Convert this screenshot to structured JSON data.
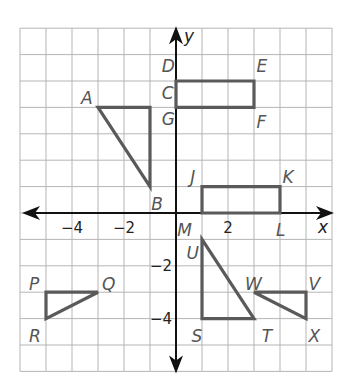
{
  "diagram": {
    "type": "coordinate-plane",
    "x_axis_label": "x",
    "y_axis_label": "y",
    "x_range": [
      -6,
      6
    ],
    "y_range": [
      -6,
      7
    ],
    "x_tick_labels": [
      {
        "value": -4,
        "text": "−4"
      },
      {
        "value": -2,
        "text": "−2"
      },
      {
        "value": 2,
        "text": "2"
      }
    ],
    "y_tick_labels": [
      {
        "value": -2,
        "text": "−2"
      },
      {
        "value": -4,
        "text": "−4"
      }
    ],
    "shapes": [
      {
        "name": "rectangle-DEFG",
        "points": [
          [
            0,
            5
          ],
          [
            3,
            5
          ],
          [
            3,
            4
          ],
          [
            0,
            4
          ]
        ]
      },
      {
        "name": "triangle-ACB",
        "points": [
          [
            -3,
            4
          ],
          [
            -1,
            4
          ],
          [
            -1,
            1
          ]
        ]
      },
      {
        "name": "rectangle-JKLM",
        "points": [
          [
            1,
            1
          ],
          [
            4,
            1
          ],
          [
            4,
            0
          ],
          [
            1,
            0
          ]
        ]
      },
      {
        "name": "triangle-PQR",
        "points": [
          [
            -5,
            -3
          ],
          [
            -3,
            -3
          ],
          [
            -5,
            -4
          ]
        ]
      },
      {
        "name": "triangle-UST",
        "points": [
          [
            1,
            -1
          ],
          [
            1,
            -4
          ],
          [
            3,
            -4
          ]
        ]
      },
      {
        "name": "triangle-WVX",
        "points": [
          [
            3,
            -3
          ],
          [
            5,
            -3
          ],
          [
            5,
            -4
          ]
        ]
      }
    ],
    "point_labels": [
      {
        "text": "D",
        "at": [
          -0.55,
          5.55
        ]
      },
      {
        "text": "E",
        "at": [
          3.1,
          5.55
        ]
      },
      {
        "text": "C",
        "at": [
          -0.55,
          4.55
        ]
      },
      {
        "text": "G",
        "at": [
          -0.55,
          3.55
        ]
      },
      {
        "text": "F",
        "at": [
          3.1,
          3.45
        ]
      },
      {
        "text": "A",
        "at": [
          -3.65,
          4.35
        ]
      },
      {
        "text": "B",
        "at": [
          -0.95,
          0.35
        ]
      },
      {
        "text": "J",
        "at": [
          0.55,
          1.35
        ]
      },
      {
        "text": "K",
        "at": [
          4.1,
          1.35
        ]
      },
      {
        "text": "M",
        "at": [
          0.05,
          -0.65
        ]
      },
      {
        "text": "L",
        "at": [
          3.85,
          -0.65
        ]
      },
      {
        "text": "U",
        "at": [
          0.4,
          -1.5
        ]
      },
      {
        "text": "S",
        "at": [
          0.6,
          -4.65
        ]
      },
      {
        "text": "T",
        "at": [
          3.3,
          -4.65
        ]
      },
      {
        "text": "W",
        "at": [
          2.65,
          -2.7
        ]
      },
      {
        "text": "V",
        "at": [
          5.1,
          -2.7
        ]
      },
      {
        "text": "X",
        "at": [
          5.1,
          -4.65
        ]
      },
      {
        "text": "P",
        "at": [
          -5.65,
          -2.7
        ]
      },
      {
        "text": "Q",
        "at": [
          -2.85,
          -2.7
        ]
      },
      {
        "text": "R",
        "at": [
          -5.65,
          -4.65
        ]
      }
    ]
  }
}
